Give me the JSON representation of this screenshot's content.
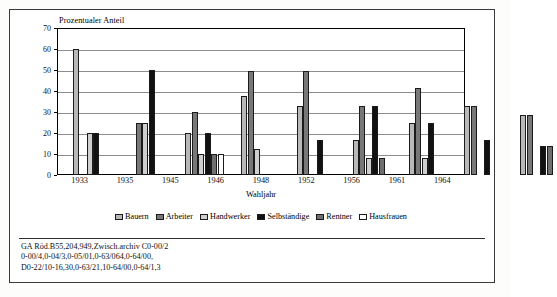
{
  "chart_data": {
    "type": "bar",
    "title": "",
    "ylabel": "Prozentualer Anteil",
    "xlabel": "Wahljahr",
    "ylim": [
      0,
      70
    ],
    "yticks": [
      0,
      10,
      20,
      30,
      40,
      50,
      60,
      70
    ],
    "grid": true,
    "legend_position": "bottom",
    "categories": [
      "1933",
      "1935",
      "1945",
      "1946",
      "1948",
      "1952",
      "1956",
      "1961",
      "1964"
    ],
    "series": [
      {
        "name": "Bauern",
        "color": "#b8b8b8",
        "values": [
          60,
          0,
          20,
          37.5,
          33,
          16.5,
          25,
          33,
          28.5
        ]
      },
      {
        "name": "Arbeiter",
        "color": "#787878",
        "values": [
          0,
          25,
          30,
          49.5,
          49.5,
          33,
          41.5,
          33,
          28.5
        ]
      },
      {
        "name": "Handwerker",
        "color": "#cfcfcf",
        "values": [
          20,
          25,
          10,
          12.5,
          0,
          8,
          8,
          0,
          0
        ]
      },
      {
        "name": "Selbständige",
        "color": "#111111",
        "values": [
          20,
          50,
          20,
          0,
          16.5,
          33,
          25,
          16.5,
          14
        ]
      },
      {
        "name": "Rentner",
        "color": "#6f6f6f",
        "values": [
          0,
          0,
          10,
          0,
          0,
          8,
          0,
          0,
          14
        ]
      },
      {
        "name": "Hausfrauen",
        "color": "#ffffff",
        "values": [
          0,
          0,
          10,
          0,
          0,
          0,
          0,
          0,
          0
        ]
      }
    ]
  },
  "footer": {
    "lines": [
      "GA Röd.B55,204,949,Zwisch.archiv C0-00/2",
      "0-00/4,0-04/3,0-05/01,0-63/064,0-64/00,",
      "D0-22/10-16,30,0-63/21,10-64/00,0-64/1,3"
    ]
  }
}
